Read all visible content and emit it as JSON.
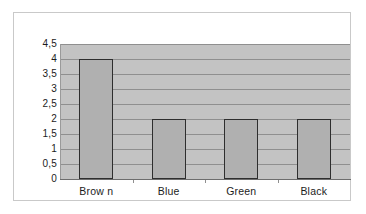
{
  "chart_data": {
    "type": "bar",
    "title": "",
    "subtitle": "",
    "xlabel": "",
    "ylabel": "",
    "categories": [
      "Brow n",
      "Blue",
      "Green",
      "Black"
    ],
    "values": [
      4,
      2,
      2,
      2
    ],
    "series": [
      {
        "name": "",
        "values": [
          4,
          2,
          2,
          2
        ]
      }
    ],
    "ylim": [
      0,
      4.5
    ],
    "ytick_labels": [
      "4,5",
      "4",
      "3,5",
      "3",
      "2,5",
      "2",
      "1,5",
      "1",
      "0,5",
      "0"
    ],
    "ytick_values": [
      4.5,
      4,
      3.5,
      3,
      2.5,
      2,
      1.5,
      1,
      0.5,
      0
    ],
    "decimal_separator": ",",
    "grid": "horizontal",
    "legend": "none",
    "legend_position": "",
    "annotations": [],
    "colors": {
      "bar_fill": "#b0b0b0",
      "bar_border": "#2e2e2e",
      "plot_background": "#c3c3c3",
      "gridline": "#8f8f8f",
      "axis_line": "#6d6d6d",
      "label_text": "#1c1c1c",
      "frame_border": "#c9c9c9",
      "page_background": "#ffffff"
    }
  }
}
